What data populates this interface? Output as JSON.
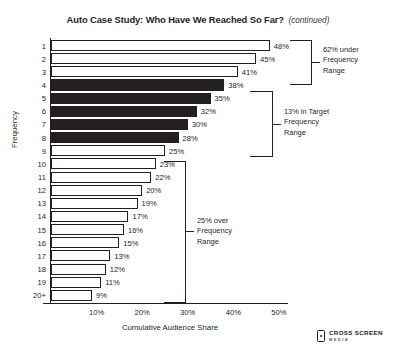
{
  "title": {
    "main": "Auto Case Study: Who Have We Reached So Far?",
    "continued": "(continued)"
  },
  "logo": {
    "icon": "device-icon",
    "line1": "CROSS SCREEN",
    "line2": "MEDIA"
  },
  "annotations": [
    {
      "id": "under",
      "text_line1": "62% under",
      "text_line2": "Frequency",
      "text_line3": "Range"
    },
    {
      "id": "target",
      "text_line1": "13% in Target",
      "text_line2": "Frequency",
      "text_line3": "Range"
    },
    {
      "id": "over",
      "text_line1": "25% over",
      "text_line2": "Frequency",
      "text_line3": "Range"
    }
  ],
  "chart_data": {
    "type": "bar",
    "orientation": "horizontal",
    "title": "Auto Case Study: Who Have We Reached So Far? (continued)",
    "xlabel": "Cumulative Audience Share",
    "ylabel": "Frequency",
    "xlim": [
      0,
      52
    ],
    "xticks": [
      "10%",
      "20%",
      "30%",
      "40%",
      "50%"
    ],
    "xtick_values": [
      10,
      20,
      30,
      40,
      50
    ],
    "grid": false,
    "legend": "none",
    "categories": [
      "1",
      "2",
      "3",
      "4",
      "5",
      "6",
      "7",
      "8",
      "9",
      "10",
      "11",
      "12",
      "13",
      "14",
      "15",
      "16",
      "17",
      "18",
      "19",
      "20+"
    ],
    "values": [
      48,
      45,
      41,
      38,
      35,
      32,
      30,
      28,
      25,
      23,
      22,
      20,
      19,
      17,
      16,
      15,
      13,
      12,
      11,
      9
    ],
    "labels": [
      "48%",
      "45%",
      "41%",
      "38%",
      "35%",
      "32%",
      "30%",
      "28%",
      "25%",
      "23%",
      "22%",
      "20%",
      "19%",
      "17%",
      "16%",
      "15%",
      "13%",
      "12%",
      "11%",
      "9%"
    ],
    "fills": [
      "open",
      "open",
      "open",
      "solid",
      "solid",
      "solid",
      "solid",
      "solid",
      "open",
      "open",
      "open",
      "open",
      "open",
      "open",
      "open",
      "open",
      "open",
      "open",
      "open",
      "open"
    ],
    "colors": {
      "solid": "#231f20",
      "open": "#ffffff",
      "outline": "#231f20"
    }
  }
}
